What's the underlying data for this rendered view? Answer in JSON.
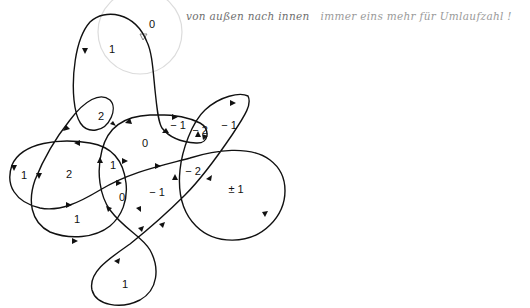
{
  "diagram": {
    "title_note": {
      "text_start": "von außen nach innen",
      "text_end": "immer eins mehr für Umlaufzahl !"
    },
    "stroke_color": "#111111",
    "ring_color": "#dcdcdc",
    "basepoint_marker": "small-triangle-marker",
    "regions": [
      {
        "id": "outer-top",
        "label": "0",
        "x": 152,
        "y": 25
      },
      {
        "id": "top-lobe",
        "label": "1",
        "x": 112,
        "y": 50
      },
      {
        "id": "small-loop",
        "label": "2",
        "x": 101,
        "y": 117
      },
      {
        "id": "center-top",
        "label": "0",
        "x": 145,
        "y": 144
      },
      {
        "id": "right-inner-a",
        "label": "− 1",
        "x": 178,
        "y": 126
      },
      {
        "id": "right-inner-b",
        "label": "− 2",
        "x": 200,
        "y": 131
      },
      {
        "id": "right-loop",
        "label": "− 1",
        "x": 229,
        "y": 126
      },
      {
        "id": "far-left",
        "label": "1",
        "x": 24,
        "y": 176
      },
      {
        "id": "left-inner",
        "label": "2",
        "x": 69,
        "y": 175
      },
      {
        "id": "center-left",
        "label": "1",
        "x": 113,
        "y": 166
      },
      {
        "id": "center-bottom",
        "label": "0",
        "x": 122,
        "y": 198
      },
      {
        "id": "center-right",
        "label": "− 1",
        "x": 157,
        "y": 193
      },
      {
        "id": "right-mid",
        "label": "− 2",
        "x": 193,
        "y": 172
      },
      {
        "id": "right-big",
        "label": "± 1",
        "x": 236,
        "y": 190
      },
      {
        "id": "left-bottom",
        "label": "1",
        "x": 77,
        "y": 220
      },
      {
        "id": "bottom-loop",
        "label": "1",
        "x": 125,
        "y": 285
      }
    ]
  }
}
